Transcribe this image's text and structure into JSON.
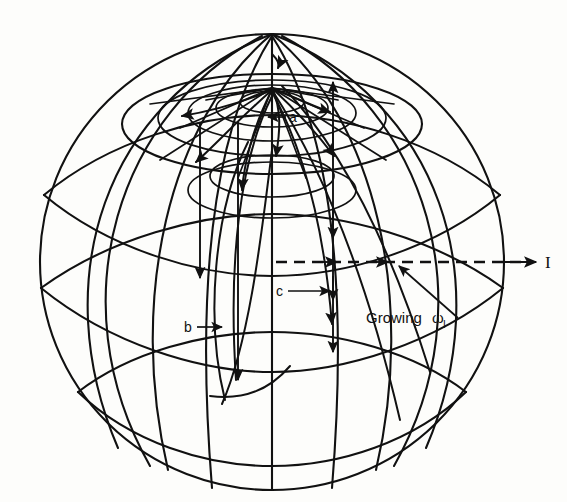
{
  "figure": {
    "type": "sphere-trajectory-diagram",
    "background_color": "#fdfdfb",
    "line_color": "#111111"
  },
  "labels": {
    "axis_I": "I",
    "trajectory_a": "a",
    "trajectory_b": "b",
    "trajectory_c": "c",
    "growing": "Growing",
    "omega": "ω",
    "omega_subscript": "I"
  },
  "geometry": {
    "sphere_center_x": 272,
    "sphere_center_y": 262,
    "sphere_radius_x": 232,
    "sphere_radius_y": 228,
    "north_pole_x": 272,
    "north_pole_y": 88,
    "axis_y": 262,
    "axis_end_x": 537
  },
  "annotations": [
    {
      "name": "a",
      "label": "a",
      "x": 292,
      "y": 118,
      "arrow": "left"
    },
    {
      "name": "b",
      "label": "b",
      "x": 190,
      "y": 327,
      "arrow": "right"
    },
    {
      "name": "c",
      "label": "c",
      "x": 279,
      "y": 291,
      "arrow": "right"
    },
    {
      "name": "growing-omega-I",
      "label": "Growing",
      "x": 388,
      "y": 318,
      "arrow": "up-left"
    },
    {
      "name": "axis-I",
      "label": "I",
      "x": 548,
      "y": 262,
      "arrow": "right"
    }
  ]
}
